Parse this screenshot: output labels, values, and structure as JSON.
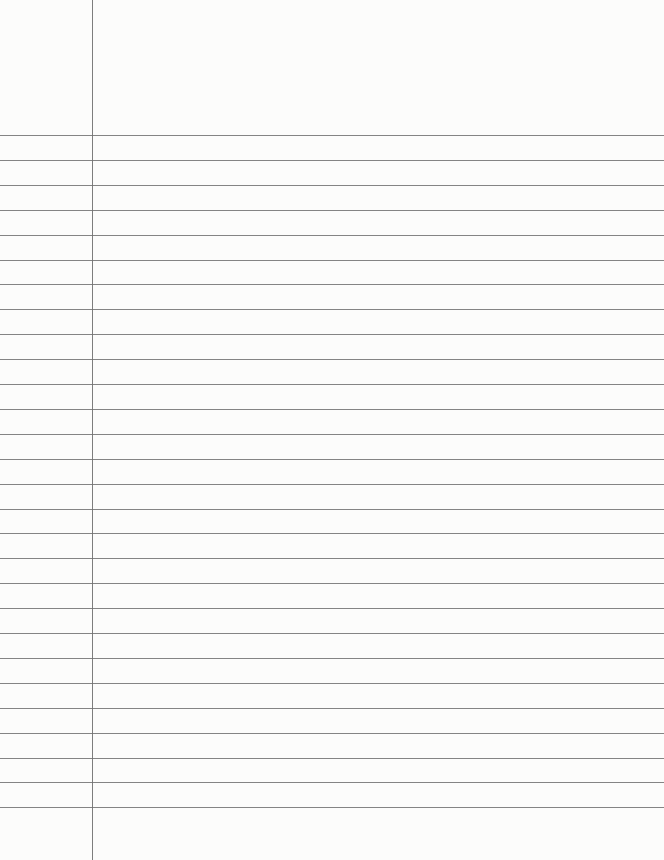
{
  "page": {
    "type": "lined-notebook-paper",
    "background_color": "#fcfcfb",
    "line_color": "#6f6f6f",
    "margin_line_color": "#7d7d7d",
    "margin_x": 92,
    "first_line_y": 135,
    "line_spacing": 24.9,
    "line_count": 28
  }
}
